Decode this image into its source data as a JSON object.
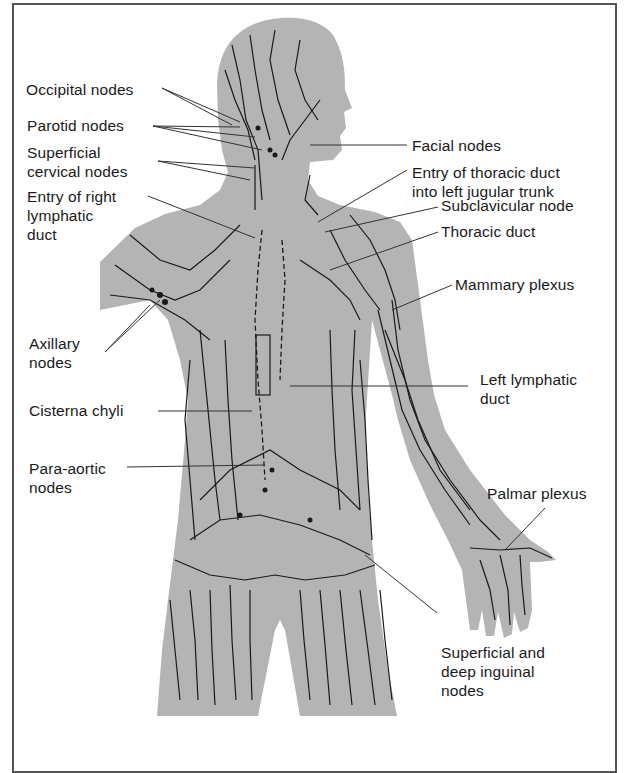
{
  "figure": {
    "colors": {
      "silhouette": "#b4b4b4",
      "vessels": "#1a1a1a",
      "leader": "#333333",
      "border": "#555555",
      "background": "#ffffff"
    }
  },
  "labels": {
    "occipital": "Occipital nodes",
    "parotid": "Parotid nodes",
    "superficial_cervical": "Superficial\ncervical nodes",
    "entry_right": "Entry of right\nlymphatic\nduct",
    "axillary": "Axillary\nnodes",
    "cisterna": "Cisterna chyli",
    "para_aortic": "Para-aortic\nnodes",
    "facial": "Facial nodes",
    "entry_thoracic": "Entry of thoracic duct\ninto left jugular trunk",
    "subclavicular": "Subclavicular node",
    "thoracic_duct": "Thoracic duct",
    "mammary": "Mammary plexus",
    "left_lymphatic": "Left lymphatic\nduct",
    "palmar": "Palmar plexus",
    "inguinal": "Superficial and\ndeep inguinal\nnodes"
  }
}
